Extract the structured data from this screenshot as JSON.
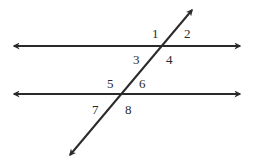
{
  "diagram": {
    "type": "parallel-lines-cut-by-transversal",
    "colors": {
      "line": "#2a2a2a",
      "background": "#ffffff"
    },
    "lines": {
      "top": {
        "x1": 14,
        "y1": 46,
        "x2": 240,
        "y2": 46
      },
      "bottom": {
        "x1": 14,
        "y1": 94,
        "x2": 240,
        "y2": 94
      },
      "transversal": {
        "x1": 70,
        "y1": 155,
        "x2": 192,
        "y2": 10
      }
    },
    "labels": [
      {
        "text": "1",
        "x": 152,
        "y": 38
      },
      {
        "text": "2",
        "x": 184,
        "y": 38
      },
      {
        "text": "3",
        "x": 133,
        "y": 64
      },
      {
        "text": "4",
        "x": 166,
        "y": 64
      },
      {
        "text": "5",
        "x": 107,
        "y": 88
      },
      {
        "text": "6",
        "x": 139,
        "y": 88
      },
      {
        "text": "7",
        "x": 92,
        "y": 114
      },
      {
        "text": "8",
        "x": 125,
        "y": 114
      }
    ]
  }
}
